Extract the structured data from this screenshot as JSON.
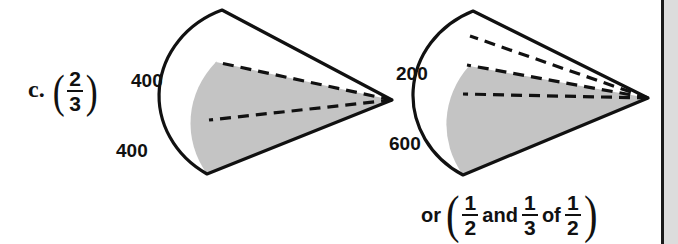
{
  "problem": {
    "letter": "c.",
    "fraction": {
      "numerator": "2",
      "denominator": "3"
    }
  },
  "diagrams": [
    {
      "name": "fan-left",
      "labels": [
        {
          "text": "400",
          "position": "upper-left"
        },
        {
          "text": "400",
          "position": "lower-left"
        }
      ],
      "total_sectors": 3,
      "shaded_sectors": 2,
      "shade_color": "#c4c4c4",
      "outline_color": "#111111"
    },
    {
      "name": "fan-right",
      "labels": [
        {
          "text": "200",
          "position": "upper-left"
        },
        {
          "text": "600",
          "position": "lower-left"
        }
      ],
      "total_sectors": 4,
      "shaded_sectors": 2,
      "shade_color": "#c4c4c4",
      "outline_color": "#111111"
    }
  ],
  "note": {
    "prefix": "or",
    "open_paren": "(",
    "first_fraction": {
      "numerator": "1",
      "denominator": "2"
    },
    "conjunction": "and",
    "second_fraction": {
      "numerator": "1",
      "denominator": "3"
    },
    "preposition": "of",
    "third_fraction": {
      "numerator": "1",
      "denominator": "2"
    },
    "close_paren": ")"
  }
}
